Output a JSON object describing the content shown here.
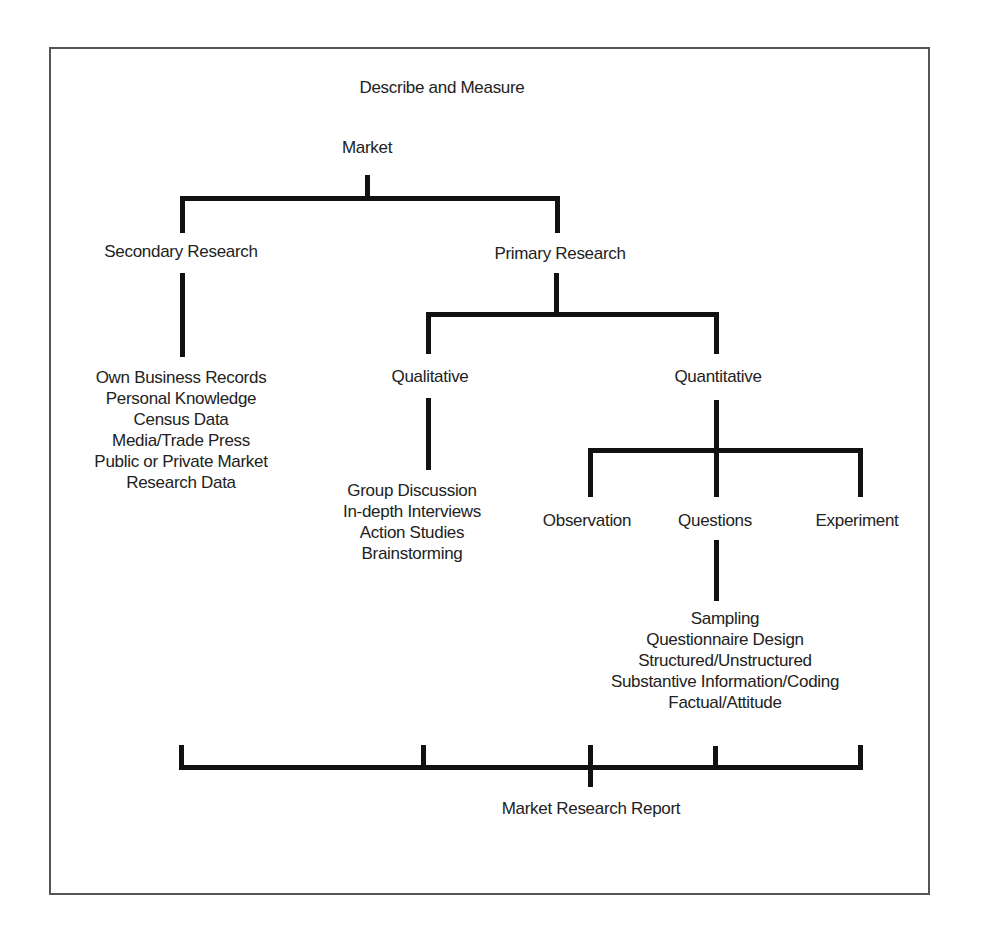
{
  "diagram": {
    "title": "Describe and Measure",
    "root": "Market",
    "branches": {
      "secondary": {
        "label": "Secondary Research",
        "items": [
          "Own Business Records",
          "Personal Knowledge",
          "Census Data",
          "Media/Trade Press",
          "Public or Private Market",
          "Research Data"
        ]
      },
      "primary": {
        "label": "Primary Research",
        "qualitative": {
          "label": "Qualitative",
          "items": [
            "Group Discussion",
            "In-depth Interviews",
            "Action Studies",
            "Brainstorming"
          ]
        },
        "quantitative": {
          "label": "Quantitative",
          "observation": {
            "label": "Observation"
          },
          "questions": {
            "label": "Questions",
            "items": [
              "Sampling",
              "Questionnaire Design",
              "Structured/Unstructured",
              "Substantive Information/Coding",
              "Factual/Attitude"
            ]
          },
          "experiment": {
            "label": "Experiment"
          }
        }
      }
    },
    "output": "Market Research Report"
  },
  "colors": {
    "line": "#111111",
    "text": "#222222",
    "frame": "#555555"
  }
}
